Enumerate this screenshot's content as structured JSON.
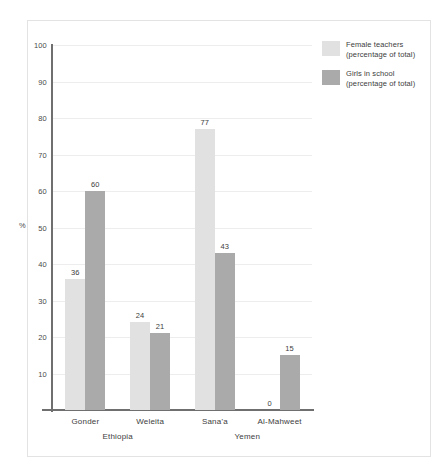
{
  "chart_data": {
    "type": "bar",
    "title": "",
    "subtitle": "",
    "xlabel": "",
    "ylabel": "%",
    "ylim": [
      0,
      100
    ],
    "ytick_step": 10,
    "yticks": [
      10,
      20,
      30,
      40,
      50,
      60,
      70,
      80,
      90,
      100
    ],
    "grid": "horizontal",
    "legend_position": "right-top",
    "categories": [
      "Gonder",
      "Weleita",
      "Sana'a",
      "Al-Mahweet"
    ],
    "groups": [
      {
        "label": "Ethiopia",
        "categories": [
          "Gonder",
          "Weleita"
        ]
      },
      {
        "label": "Yemen",
        "categories": [
          "Sana'a",
          "Al-Mahweet"
        ]
      }
    ],
    "series": [
      {
        "name": "Female teachers (percentage of total)",
        "name_line1": "Female teachers",
        "name_line2": "(percentage of total)",
        "color": "#e1e1e1",
        "values": [
          36,
          24,
          77,
          0
        ]
      },
      {
        "name": "Girls in school (percentage of total)",
        "name_line1": "Girls in school",
        "name_line2": "(percentage of total)",
        "color": "#aaaaaa",
        "values": [
          60,
          21,
          43,
          15
        ]
      }
    ]
  },
  "axis": {
    "y_title": "%",
    "tick_labels": [
      "100",
      "90",
      "80",
      "70",
      "60",
      "50",
      "40",
      "30",
      "20",
      "10"
    ]
  },
  "categories": [
    {
      "label": "Gonder"
    },
    {
      "label": "Weleita"
    },
    {
      "label": "Sana'a"
    },
    {
      "label": "Al-Mahweet"
    }
  ],
  "groups": [
    {
      "label": "Ethiopia"
    },
    {
      "label": "Yemen"
    }
  ],
  "legend": {
    "items": [
      {
        "line1": "Female teachers",
        "line2": "(percentage of total)",
        "color": "#e1e1e1"
      },
      {
        "line1": "Girls in school",
        "line2": "(percentage of total)",
        "color": "#aaaaaa"
      }
    ]
  },
  "values": {
    "gonder_female_teachers": "36",
    "gonder_girls_school": "60",
    "weleita_female_teachers": "24",
    "weleita_girls_school": "21",
    "sanaa_female_teachers": "77",
    "sanaa_girls_school": "43",
    "almahweet_female_teachers": "0",
    "almahweet_girls_school": "15"
  }
}
